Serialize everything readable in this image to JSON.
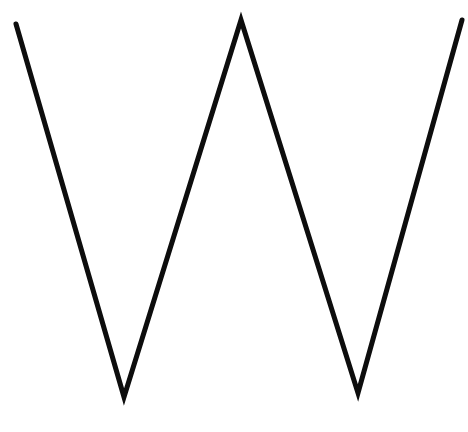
{
  "figure": {
    "background_color": "#ffffff",
    "stroke_color": "#0d0d0d",
    "stroke_width": "5",
    "points": "16,24 124,397 241,20 358,393 462,20",
    "vertices": [
      {
        "x": 16,
        "y": 24,
        "label": "top-left-end"
      },
      {
        "x": 124,
        "y": 397,
        "label": "left-valley"
      },
      {
        "x": 241,
        "y": 20,
        "label": "middle-peak"
      },
      {
        "x": 358,
        "y": 393,
        "label": "right-valley"
      },
      {
        "x": 462,
        "y": 20,
        "label": "top-right-end"
      }
    ]
  }
}
